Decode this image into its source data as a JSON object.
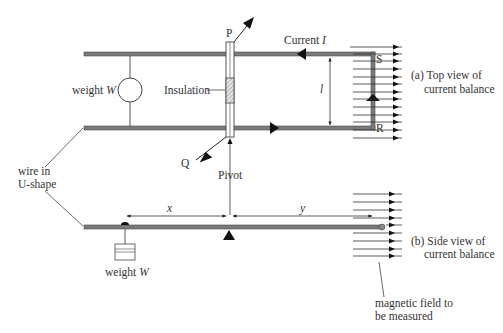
{
  "diagram": {
    "type": "physics-apparatus",
    "subject": "current balance",
    "colors": {
      "wire": "#7a7a7a",
      "wire_edge": "#4a4a4a",
      "line": "#333333",
      "text": "#333333",
      "insulation_hatch": "#777777"
    },
    "top_view": {
      "caption_line1": "(a) Top view of",
      "caption_line2": "current balance",
      "current_label": "Current ",
      "current_symbol": "I",
      "length_symbol": "l",
      "point_p": "P",
      "point_q": "Q",
      "point_s": "S",
      "point_r": "R",
      "insulation_label": "Insulation",
      "weight_label": "weight ",
      "weight_symbol": "W",
      "pivot_label": "Pivot"
    },
    "side_view": {
      "caption_line1": "(b) Side view of",
      "caption_line2": "current balance",
      "distance_x": "x",
      "distance_y": "y",
      "weight_label": "weight ",
      "weight_symbol": "W"
    },
    "shared_labels": {
      "wire_label_line1": "wire in",
      "wire_label_line2": "U-shape",
      "field_label_line1": "magnetic field to",
      "field_label_line2": "be measured"
    },
    "field_lines": {
      "top_view_count": 13,
      "side_view_count": 9,
      "direction": "right"
    }
  }
}
